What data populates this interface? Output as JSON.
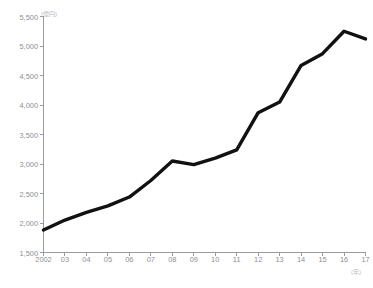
{
  "chart_data": {
    "type": "line",
    "title": "",
    "subtitle": "",
    "xlabel": "(年)",
    "ylabel": "(億円)",
    "ylim": [
      1500,
      5500
    ],
    "ytick_step": 500,
    "yticks": [
      "5,500",
      "5,000",
      "4,500",
      "4,000",
      "3,500",
      "3,000",
      "2,500",
      "2,000",
      "1,500"
    ],
    "ytick_values": [
      5500,
      5000,
      4500,
      4000,
      3500,
      3000,
      2500,
      2000,
      1500
    ],
    "categories": [
      "2002",
      "03",
      "04",
      "05",
      "06",
      "07",
      "08",
      "09",
      "10",
      "11",
      "12",
      "13",
      "14",
      "15",
      "16",
      "17"
    ],
    "x": [
      2002,
      2003,
      2004,
      2005,
      2006,
      2007,
      2008,
      2009,
      2010,
      2011,
      2012,
      2013,
      2014,
      2015,
      2016,
      2017
    ],
    "values": [
      1880,
      2050,
      2180,
      2290,
      2440,
      2720,
      3050,
      2990,
      3100,
      3240,
      3870,
      4050,
      4670,
      4870,
      5250,
      5120
    ],
    "series": [
      {
        "name": "",
        "values": [
          1880,
          2050,
          2180,
          2290,
          2440,
          2720,
          3050,
          2990,
          3100,
          3240,
          3870,
          4050,
          4670,
          4870,
          5250,
          5120
        ]
      }
    ],
    "grid": false,
    "legend": false,
    "legend_position": "none",
    "line_color": "#111111",
    "line_width": 3.4,
    "axis_color": "#9a9aa0",
    "tick_label_color": "#8e8e94"
  }
}
